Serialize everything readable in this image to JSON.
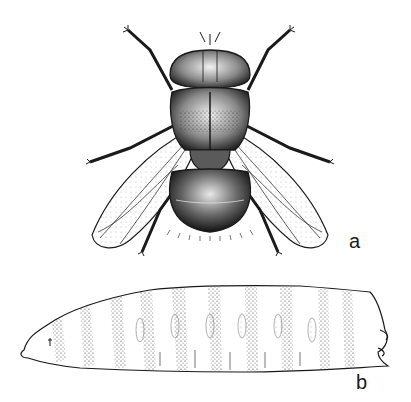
{
  "figure": {
    "panels": [
      {
        "id": "a",
        "label": "a",
        "subject": "adult fly, dorsal view"
      },
      {
        "id": "b",
        "label": "b",
        "subject": "larva (maggot), lateral view"
      }
    ],
    "colors": {
      "ink": "#1a1a1a",
      "background": "#ffffff",
      "stipple": "#555555"
    }
  }
}
